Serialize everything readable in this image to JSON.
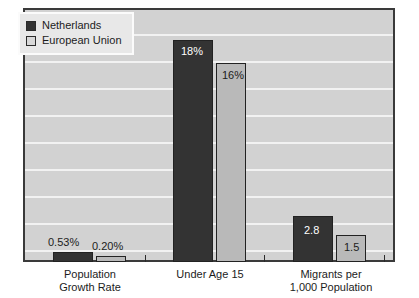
{
  "chart_data": {
    "type": "bar",
    "title": "",
    "subtitle": "",
    "xlabel": "",
    "ylabel": "",
    "grid": true,
    "gridlines": 9,
    "legend_position": "top-left",
    "ylim": [
      0,
      20
    ],
    "categories": [
      "Population\nGrowth Rate",
      "Under Age 15",
      "Migrants per\n1,000 Population"
    ],
    "category_lines": [
      [
        "Population",
        "Growth Rate"
      ],
      [
        "Under Age 15"
      ],
      [
        "Migrants per",
        "1,000 Population"
      ]
    ],
    "series": [
      {
        "name": "Netherlands",
        "color": "#333333",
        "values": [
          0.53,
          18,
          2.8
        ],
        "labels": [
          "0.53%",
          "18%",
          "2.8"
        ]
      },
      {
        "name": "European Union",
        "color": "#b9b9b9",
        "values": [
          0.2,
          16,
          1.5
        ],
        "labels": [
          "0.20%",
          "16%",
          "1.5"
        ]
      }
    ],
    "colors": {
      "netherlands": "#333333",
      "european_union": "#b9b9b9",
      "plot_background": "#d2d2d2",
      "gridline": "#f2f2f2",
      "frame": "#3a3a3a",
      "page_background": "#ffffff",
      "text": "#1c1c1c"
    }
  },
  "legend": {
    "items": [
      {
        "label": "Netherlands",
        "swatch": "dark"
      },
      {
        "label": "European Union",
        "swatch": "light"
      }
    ]
  },
  "bars": [
    {
      "name": "bar-population-growth-netherlands",
      "label": "0.53%",
      "series": 0,
      "group": 0,
      "left": 53,
      "width": 40,
      "top": 252,
      "height": 10,
      "label_left": 48,
      "label_top": 236,
      "label_style": "above"
    },
    {
      "name": "bar-population-growth-eu",
      "label": "0.20%",
      "series": 1,
      "group": 0,
      "left": 96,
      "width": 30,
      "top": 256,
      "height": 6,
      "label_left": 92,
      "label_top": 240,
      "label_style": "above"
    },
    {
      "name": "bar-under-age-15-netherlands",
      "label": "18%",
      "series": 0,
      "group": 1,
      "left": 173,
      "width": 40,
      "top": 40,
      "height": 222,
      "label_left": 181,
      "label_top": 45,
      "label_style": "inside-dark"
    },
    {
      "name": "bar-under-age-15-eu",
      "label": "16%",
      "series": 1,
      "group": 1,
      "left": 216,
      "width": 30,
      "top": 63,
      "height": 199,
      "label_left": 222,
      "label_top": 69,
      "label_style": "inside-light"
    },
    {
      "name": "bar-migrants-netherlands",
      "label": "2.8",
      "series": 0,
      "group": 2,
      "left": 293,
      "width": 40,
      "top": 216,
      "height": 46,
      "label_left": 304,
      "label_top": 224,
      "label_style": "inside-dark"
    },
    {
      "name": "bar-migrants-eu",
      "label": "1.5",
      "series": 1,
      "group": 2,
      "left": 336,
      "width": 30,
      "top": 235,
      "height": 27,
      "label_left": 344,
      "label_top": 241,
      "label_style": "inside-light"
    }
  ],
  "ticks": [
    {
      "left": 145
    },
    {
      "left": 264
    },
    {
      "left": 384
    }
  ],
  "category_labels": [
    {
      "name": "category-label-population-growth-rate",
      "left": 30,
      "width": 120,
      "lines": [
        "Population",
        "Growth Rate"
      ]
    },
    {
      "name": "category-label-under-age-15",
      "left": 150,
      "width": 120,
      "lines": [
        "Under Age 15"
      ]
    },
    {
      "name": "category-label-migrants",
      "left": 266,
      "width": 130,
      "lines": [
        "Migrants per",
        "1,000 Population"
      ]
    }
  ]
}
